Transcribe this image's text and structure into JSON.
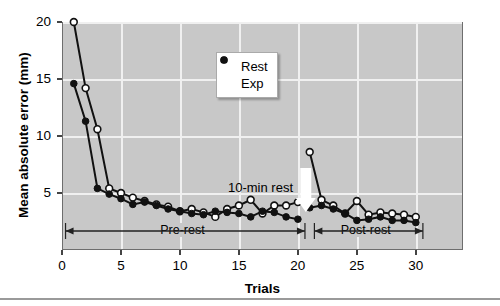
{
  "chart_data": {
    "type": "line",
    "title": "",
    "xlabel": "Trials",
    "ylabel": "Mean absolute error (mm)",
    "xlim": [
      0,
      34
    ],
    "ylim": [
      0,
      20
    ],
    "xticks": [
      0,
      5,
      10,
      15,
      20,
      25,
      30
    ],
    "yticks": [
      5,
      10,
      15,
      20
    ],
    "grid": true,
    "legend_position": "upper-center",
    "x": [
      1,
      2,
      3,
      4,
      5,
      6,
      7,
      8,
      9,
      10,
      11,
      12,
      13,
      14,
      15,
      16,
      17,
      18,
      19,
      20,
      21,
      22,
      23,
      24,
      25,
      26,
      27,
      28,
      29,
      30
    ],
    "series": [
      {
        "name": "Rest",
        "marker": "open-circle",
        "values": [
          20.0,
          14.2,
          10.6,
          5.4,
          5.0,
          4.6,
          4.3,
          4.0,
          3.8,
          3.4,
          3.6,
          3.3,
          2.9,
          3.6,
          3.9,
          4.4,
          3.2,
          3.9,
          3.9,
          4.2,
          8.6,
          4.4,
          3.9,
          3.2,
          4.3,
          3.1,
          3.3,
          3.2,
          3.1,
          2.9
        ]
      },
      {
        "name": "Exp",
        "marker": "filled-circle",
        "values": [
          14.6,
          11.3,
          5.4,
          4.9,
          4.5,
          4.0,
          4.2,
          3.9,
          3.6,
          3.4,
          3.2,
          3.1,
          3.4,
          3.3,
          3.2,
          2.9,
          3.4,
          3.3,
          2.9,
          2.7,
          3.7,
          3.9,
          3.6,
          3.2,
          2.6,
          2.7,
          2.9,
          2.6,
          2.6,
          2.4
        ]
      }
    ],
    "annotations": [
      {
        "id": "rest-note",
        "text": "10-min rest"
      },
      {
        "id": "phase-pre",
        "text": "Pre-rest"
      },
      {
        "id": "phase-post",
        "text": "Post-rest"
      }
    ]
  },
  "legend": {
    "entries": [
      {
        "label": "Rest",
        "symbol": "open-circle"
      },
      {
        "label": "Exp",
        "symbol": "filled-circle"
      }
    ]
  },
  "axes": {
    "y_label": "Mean absolute error (mm)",
    "x_label": "Trials",
    "y_ticks": [
      "5",
      "10",
      "15",
      "20"
    ],
    "x_ticks": [
      "0",
      "5",
      "10",
      "15",
      "20",
      "25",
      "30"
    ]
  },
  "annotations": {
    "rest_note": "10-min rest",
    "pre_rest": "Pre-rest",
    "post_rest": "Post-rest"
  },
  "colors": {
    "plot_background": "#c8c8c8",
    "gridline": "#f0f0f0",
    "line": "#111111",
    "marker_open_fill": "#ffffff",
    "arrow_white": "#ffffff"
  }
}
